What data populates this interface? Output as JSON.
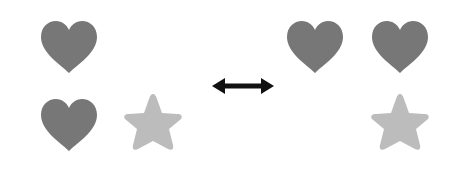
{
  "diagram": {
    "colors": {
      "heart": "#777777",
      "star": "#bcbcbc",
      "arrow": "#111111",
      "background": "#ffffff"
    },
    "left_group": {
      "label": "left set",
      "items": [
        {
          "shape": "heart",
          "row": 1,
          "col": 1
        },
        {
          "shape": "heart",
          "row": 2,
          "col": 1
        },
        {
          "shape": "star",
          "row": 2,
          "col": 2
        }
      ]
    },
    "connector": {
      "icon": "double-headed-arrow",
      "label": "equivalent / swap"
    },
    "right_group": {
      "label": "right set",
      "items": [
        {
          "shape": "heart",
          "row": 1,
          "col": 1
        },
        {
          "shape": "heart",
          "row": 1,
          "col": 2
        },
        {
          "shape": "star",
          "row": 2,
          "col": 2
        }
      ]
    }
  }
}
